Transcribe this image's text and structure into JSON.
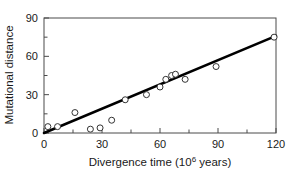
{
  "chart_data": {
    "type": "scatter",
    "title": "",
    "xlabel": "Divergence time (10⁶ years)",
    "xlabel_base": "Divergence time (10",
    "xlabel_sup": "6",
    "xlabel_tail": " years)",
    "ylabel": "Mutational distance",
    "xlim": [
      0,
      120
    ],
    "ylim": [
      0,
      90
    ],
    "xticks": [
      0,
      30,
      60,
      90,
      120
    ],
    "yticks": [
      0,
      30,
      60,
      90
    ],
    "xtick_labels": [
      "0",
      "30",
      "60",
      "90",
      "120"
    ],
    "ytick_labels": [
      "0",
      "30",
      "60",
      "90"
    ],
    "x_minor_ticks": [
      15,
      45,
      75,
      105
    ],
    "y_minor_ticks": [
      15,
      45,
      75
    ],
    "grid": false,
    "legend": false,
    "marker_style": "open-circle",
    "marker_radius": 3,
    "series": [
      {
        "name": "observations",
        "x": [
          2,
          7,
          16,
          24,
          29,
          35,
          42,
          53,
          60,
          63,
          66,
          68,
          73,
          89,
          119
        ],
        "y": [
          5,
          5,
          16,
          3,
          4,
          10,
          26,
          30,
          36,
          42,
          45,
          46,
          42,
          52,
          75
        ]
      }
    ],
    "trendline": {
      "name": "linear fit through origin",
      "x": [
        0,
        120
      ],
      "y": [
        0,
        76
      ],
      "color": "#000000",
      "width": 2.6
    },
    "colors": {
      "marker_fill": "#ffffff",
      "marker_stroke": "#333333",
      "line": "#000000",
      "axis": "#4a4a4a",
      "text": "#1a1a1a",
      "background": "#ffffff"
    }
  },
  "geometry": {
    "plot_left": 44,
    "plot_right": 276,
    "plot_top": 18,
    "plot_bottom": 133
  }
}
